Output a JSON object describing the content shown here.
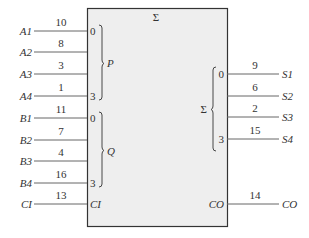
{
  "block": {
    "title": "Σ",
    "fill": "#eeeeee",
    "border": "#333333"
  },
  "groups": {
    "P": "P",
    "Q": "Q",
    "sum": "Σ"
  },
  "inputs": [
    {
      "name": "A1",
      "value": "10",
      "pin": "0"
    },
    {
      "name": "A2",
      "value": "8",
      "pin": ""
    },
    {
      "name": "A3",
      "value": "3",
      "pin": ""
    },
    {
      "name": "A4",
      "value": "1",
      "pin": "3"
    },
    {
      "name": "B1",
      "value": "11",
      "pin": "0"
    },
    {
      "name": "B2",
      "value": "7",
      "pin": ""
    },
    {
      "name": "B3",
      "value": "4",
      "pin": ""
    },
    {
      "name": "B4",
      "value": "16",
      "pin": "3"
    },
    {
      "name": "CI",
      "value": "13",
      "pin": "CI"
    }
  ],
  "outputs": [
    {
      "name": "S1",
      "value": "9",
      "pin": "0"
    },
    {
      "name": "S2",
      "value": "6",
      "pin": ""
    },
    {
      "name": "S3",
      "value": "2",
      "pin": ""
    },
    {
      "name": "S4",
      "value": "15",
      "pin": "3"
    },
    {
      "name": "CO",
      "value": "14",
      "pin": "CO"
    }
  ]
}
